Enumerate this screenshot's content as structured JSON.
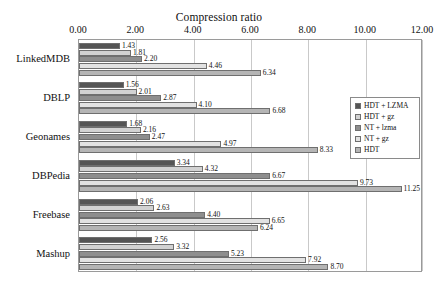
{
  "chart_data": {
    "type": "bar",
    "orientation": "horizontal",
    "title": "Compression ratio",
    "xlabel": "",
    "ylabel": "",
    "xlim": [
      0.0,
      12.0
    ],
    "xticks": [
      "0.00",
      "2.00",
      "4.00",
      "6.00",
      "8.00",
      "10.00",
      "12.00"
    ],
    "xtick_values": [
      0,
      2,
      4,
      6,
      8,
      10,
      12
    ],
    "grid": true,
    "legend_position": "right",
    "categories": [
      "LinkedMDB",
      "DBLP",
      "Geonames",
      "DBPedia",
      "Freebase",
      "Mashup"
    ],
    "series": [
      {
        "name": "HDT + LZMA",
        "color": "#555555",
        "values": [
          1.43,
          1.56,
          1.68,
          3.34,
          2.06,
          2.56
        ],
        "labels": [
          "1.43",
          "1.56",
          "1.68",
          "3.34",
          "2.06",
          "2.56"
        ]
      },
      {
        "name": "HDT + gz",
        "color": "#d2d2d2",
        "values": [
          1.81,
          2.01,
          2.16,
          4.32,
          2.63,
          3.32
        ],
        "labels": [
          "1.81",
          "2.01",
          "2.16",
          "4.32",
          "2.63",
          "3.32"
        ]
      },
      {
        "name": "NT + lzma",
        "color": "#8e8e8e",
        "values": [
          2.2,
          2.87,
          2.47,
          6.67,
          4.4,
          5.23
        ],
        "labels": [
          "2.20",
          "2.87",
          "2.47",
          "6.67",
          "4.40",
          "5.23"
        ]
      },
      {
        "name": "NT + gz",
        "color": "#e2e2e2",
        "values": [
          4.46,
          4.1,
          4.97,
          9.73,
          6.65,
          7.92
        ],
        "labels": [
          "4.46",
          "4.10",
          "4.97",
          "9.73",
          "6.65",
          "7.92"
        ]
      },
      {
        "name": "HDT",
        "color": "#b5b5b5",
        "values": [
          6.34,
          6.68,
          8.33,
          11.25,
          6.24,
          8.7
        ],
        "labels": [
          "6.34",
          "6.68",
          "8.33",
          "11.25",
          "6.24",
          "8.70"
        ]
      }
    ]
  }
}
